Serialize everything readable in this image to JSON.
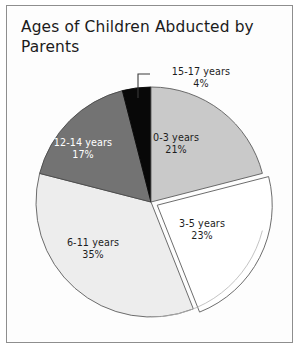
{
  "document": {
    "title": "Ages of Children Abducted by\nParents",
    "frame_color": "#8e8e8e",
    "background": "#ffffff"
  },
  "chart_data": {
    "type": "pie",
    "title": "Ages of Children Abducted by Parents",
    "xlabel": "",
    "ylabel": "",
    "legend_position": "none",
    "labels_on_slices": true,
    "units": "percent",
    "total": 100,
    "categories": [
      "0-3 years",
      "3-5 years",
      "6-11 years",
      "12-14 years",
      "15-17 years"
    ],
    "values": [
      21,
      23,
      35,
      17,
      4
    ],
    "colors": [
      "#c9c9c9",
      "#ffffff",
      "#ededed",
      "#737373",
      "#080808"
    ],
    "start_angle_deg": 0,
    "direction": "clockwise",
    "exploded": [
      "3-5 years"
    ],
    "slices": [
      {
        "name": "0-3 years",
        "value": 21,
        "label": "0-3 years",
        "percent_label": "21%",
        "color": "#c9c9c9",
        "text_color": "#1d1d1d",
        "label_placement": "inside",
        "start_deg": 0,
        "end_deg": 75.6,
        "exploded": false
      },
      {
        "name": "3-5 years",
        "value": 23,
        "label": "3-5 years",
        "percent_label": "23%",
        "color": "#ffffff",
        "text_color": "#1d1d1d",
        "label_placement": "inside",
        "start_deg": 75.6,
        "end_deg": 158.4,
        "exploded": true
      },
      {
        "name": "6-11 years",
        "value": 35,
        "label": "6-11 years",
        "percent_label": "35%",
        "color": "#ededed",
        "text_color": "#1d1d1d",
        "label_placement": "inside",
        "start_deg": 158.4,
        "end_deg": 284.4,
        "exploded": false
      },
      {
        "name": "12-14 years",
        "value": 17,
        "label": "12-14 years",
        "percent_label": "17%",
        "color": "#737373",
        "text_color": "#ffffff",
        "label_placement": "inside",
        "start_deg": 284.4,
        "end_deg": 345.6,
        "exploded": false
      },
      {
        "name": "15-17 years",
        "value": 4,
        "label": "15-17 years",
        "percent_label": "4%",
        "color": "#080808",
        "text_color": "#1d1d1d",
        "label_placement": "callout",
        "start_deg": 345.6,
        "end_deg": 360,
        "exploded": false
      }
    ]
  }
}
